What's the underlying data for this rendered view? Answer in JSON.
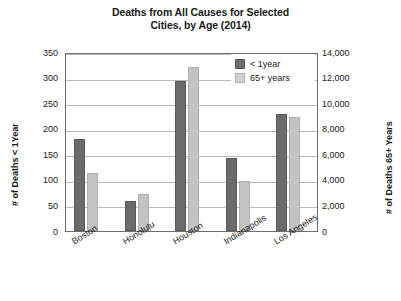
{
  "chart_data": {
    "type": "bar",
    "title": "Deaths from All Causes for Selected Cities, by Age (2014)",
    "title_line1": "Deaths from All Causes for Selected",
    "title_line2": "Cities, by Age (2014)",
    "categories": [
      "Boston",
      "Honolulu",
      "Houston",
      "Indianapolis",
      "Los Angeles"
    ],
    "series": [
      {
        "name": "< 1year",
        "axis": "left",
        "color": "#6b6b6b",
        "values": [
          180,
          58,
          293,
          142,
          229
        ]
      },
      {
        "name": "65+ years",
        "axis": "right",
        "color": "#c3c3c3",
        "values": [
          4500,
          2900,
          12800,
          3900,
          8900
        ]
      }
    ],
    "xlabel": "",
    "ylabel_left": "# of Deaths < 1Year",
    "ylabel_right": "# of Deaths 65+ Years",
    "ylim_left": [
      0,
      350
    ],
    "ylim_right": [
      0,
      14000
    ],
    "yticks_left": [
      "350",
      "300",
      "250",
      "200",
      "150",
      "100",
      "50",
      "0"
    ],
    "yticks_right": [
      "14,000",
      "12,000",
      "10,000",
      "8,000",
      "6,000",
      "4,000",
      "2,000",
      "0"
    ],
    "grid": true,
    "legend_position": "top-right",
    "legend": [
      "< 1year",
      "65+ years"
    ]
  }
}
